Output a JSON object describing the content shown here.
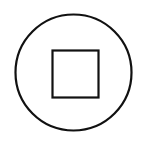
{
  "control": {
    "icon": "stop-icon",
    "label": "Stop",
    "colors": {
      "background": "#ffffff",
      "stroke": "#111111"
    },
    "geometry": {
      "circle": {
        "cx": 73.5,
        "cy": 72.5,
        "r": 58,
        "stroke_width": 2.2
      },
      "square": {
        "x": 52.5,
        "y": 50.5,
        "width": 46,
        "height": 47,
        "stroke_width": 2.2
      }
    }
  }
}
